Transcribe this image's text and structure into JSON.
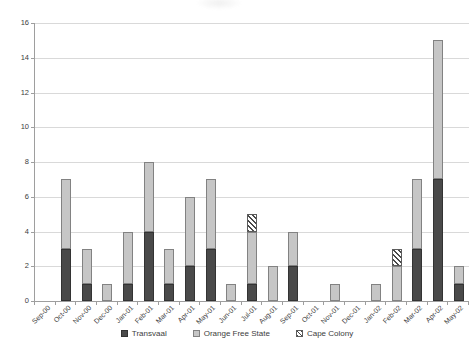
{
  "chart_data": {
    "type": "bar",
    "stacked": true,
    "title": "",
    "xlabel": "",
    "ylabel": "",
    "categories": [
      "Sep-00",
      "Oct-00",
      "Nov-00",
      "Dec-00",
      "Jan-01",
      "Feb-01",
      "Mar-01",
      "Apr-01",
      "May-01",
      "Jun-01",
      "Jul-01",
      "Aug-01",
      "Sep-01",
      "Oct-01",
      "Nov-01",
      "Dec-01",
      "Jan-02",
      "Feb-02",
      "Mar-02",
      "Apr-02",
      "May-02"
    ],
    "series": [
      {
        "name": "Transvaal",
        "color": "#4a4a4a",
        "border": "#333333",
        "pattern": "solid",
        "values": [
          0,
          3,
          1,
          0,
          1,
          4,
          1,
          2,
          3,
          0,
          1,
          0,
          2,
          0,
          0,
          0,
          0,
          0,
          3,
          7,
          1
        ]
      },
      {
        "name": "Orange Free State",
        "color": "#c6c6c6",
        "border": "#828282",
        "pattern": "solid",
        "values": [
          0,
          4,
          2,
          1,
          3,
          4,
          2,
          4,
          4,
          1,
          3,
          2,
          2,
          0,
          1,
          0,
          1,
          2,
          4,
          8,
          1
        ]
      },
      {
        "name": "Cape Colony",
        "color": "#ffffff",
        "border": "#5c5c5c",
        "pattern": "diagonal-hatch",
        "values": [
          0,
          0,
          0,
          0,
          0,
          0,
          0,
          0,
          0,
          0,
          1,
          0,
          0,
          0,
          0,
          0,
          0,
          1,
          0,
          0,
          0
        ]
      }
    ],
    "ylim": [
      0,
      16
    ],
    "yticks": [
      0,
      2,
      4,
      6,
      8,
      10,
      12,
      14,
      16
    ],
    "grid": "horizontal",
    "legend_position": "bottom",
    "colors": {
      "grid": "#d9d9d9",
      "axis": "#9e9e9e",
      "text": "#3d3d3d",
      "background": "#ffffff"
    }
  }
}
